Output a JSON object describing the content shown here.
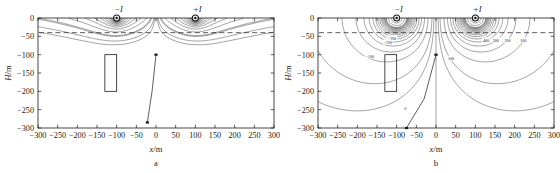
{
  "figure": {
    "panels": [
      {
        "id": "a",
        "caption": "a",
        "xlabel_var": "x",
        "xlabel_unit": "/m",
        "ylabel_var": "H",
        "ylabel_unit": "/m",
        "xticks": [
          "-300",
          "-250",
          "-200",
          "-150",
          "-100",
          "-50",
          "0",
          "50",
          "100",
          "150",
          "200",
          "250",
          "300"
        ],
        "yticks": [
          "0",
          "-50",
          "-100",
          "-150",
          "-200",
          "-250",
          "-300"
        ],
        "sources": [
          {
            "label": "−I",
            "x": -100,
            "y": 0
          },
          {
            "label": "+I",
            "x": 100,
            "y": 0
          }
        ],
        "reference_depth": -40,
        "body_rect": {
          "x0": -130,
          "x1": -100,
          "y0": -100,
          "y1": -200
        },
        "borehole": {
          "points": [
            [
              0,
              -100
            ],
            [
              -10,
              -200
            ],
            [
              -22,
              -285
            ]
          ]
        },
        "contour_labels": []
      },
      {
        "id": "b",
        "caption": "b",
        "xlabel_var": "x",
        "xlabel_unit": "/m",
        "ylabel_var": "H",
        "ylabel_unit": "/m",
        "xticks": [
          "-300",
          "-250",
          "-200",
          "-150",
          "-100",
          "-50",
          "0",
          "50",
          "100",
          "150",
          "200",
          "250",
          "300"
        ],
        "yticks": [
          "0",
          "-50",
          "-100",
          "-150",
          "-200",
          "-250",
          "-300"
        ],
        "sources": [
          {
            "label": "−I",
            "x": -100,
            "y": 0
          },
          {
            "label": "+I",
            "x": 100,
            "y": 0
          }
        ],
        "reference_depth": -40,
        "body_rect": {
          "x0": -130,
          "x1": -100,
          "y0": -100,
          "y1": -200
        },
        "borehole": {
          "points": [
            [
              0,
              -100
            ],
            [
              -30,
              -220
            ],
            [
              -75,
              -300
            ]
          ]
        },
        "contour_labels": [
          {
            "text": "-300",
            "x": -112,
            "y": -55
          },
          {
            "text": "-200",
            "x": -122,
            "y": -66
          },
          {
            "text": "-100",
            "x": -168,
            "y": -104
          },
          {
            "text": "400",
            "x": 127,
            "y": -60
          },
          {
            "text": "300",
            "x": 152,
            "y": -60
          },
          {
            "text": "200",
            "x": 182,
            "y": -62
          },
          {
            "text": "100",
            "x": 222,
            "y": -60
          },
          {
            "text": "100",
            "x": 38,
            "y": -110
          },
          {
            "text": "0",
            "x": -78,
            "y": -247
          }
        ]
      }
    ]
  },
  "chart_data": {
    "type": "line",
    "title": "",
    "xlabel": "x/m",
    "ylabel": "H/m",
    "xlim": [
      -300,
      300
    ],
    "ylim": [
      -300,
      0
    ],
    "xticks": [
      -300,
      -250,
      -200,
      -150,
      -100,
      -50,
      0,
      50,
      100,
      150,
      200,
      250,
      300
    ],
    "yticks": [
      0,
      -50,
      -100,
      -150,
      -200,
      -250,
      -300
    ],
    "grid": false,
    "legend": "none",
    "subplots": [
      {
        "id": "a",
        "caption": "a",
        "description": "Localized contour lobes confined to the near-surface beneath each current electrode; field decays rapidly with depth.",
        "sources": [
          {
            "name": "-I",
            "x": -100,
            "y": 0
          },
          {
            "name": "+I",
            "x": 100,
            "y": 0
          }
        ],
        "reference_line_depth": -40,
        "contour_levels": [
          -400,
          -350,
          -300,
          -250,
          -200,
          -150,
          -100,
          -80,
          -60,
          -40,
          -20,
          0,
          20,
          40,
          60,
          80,
          100,
          150,
          200,
          250,
          300,
          350,
          400
        ],
        "annotated_labels": []
      },
      {
        "id": "b",
        "caption": "b",
        "description": "Broad dipolar contour pattern spanning the full section; negative lobes left of x=0, positive lobes right of x=0, zero contour passing obliquely near x=-75 m at depth.",
        "sources": [
          {
            "name": "-I",
            "x": -100,
            "y": 0
          },
          {
            "name": "+I",
            "x": 100,
            "y": 0
          }
        ],
        "reference_line_depth": -40,
        "contour_levels": [
          -400,
          -300,
          -200,
          -100,
          -50,
          0,
          50,
          100,
          200,
          300,
          400
        ],
        "annotated_labels": [
          {
            "value": -300,
            "x": -112,
            "y": -55
          },
          {
            "value": -200,
            "x": -122,
            "y": -66
          },
          {
            "value": -100,
            "x": -168,
            "y": -104
          },
          {
            "value": 400,
            "x": 127,
            "y": -60
          },
          {
            "value": 300,
            "x": 152,
            "y": -60
          },
          {
            "value": 200,
            "x": 182,
            "y": -62
          },
          {
            "value": 100,
            "x": 222,
            "y": -60
          },
          {
            "value": 100,
            "x": 38,
            "y": -110
          },
          {
            "value": 0,
            "x": -78,
            "y": -247
          }
        ]
      }
    ],
    "annotations": {
      "body_rect": {
        "x0": -130,
        "x1": -100,
        "y0": -100,
        "y1": -200,
        "meaning": "anomalous body"
      },
      "borehole_label": "borehole trace with measurement points"
    }
  },
  "colors": {
    "ink": "#1a1a1a",
    "contour": "#2a2a2a",
    "background": "#ffffff"
  }
}
